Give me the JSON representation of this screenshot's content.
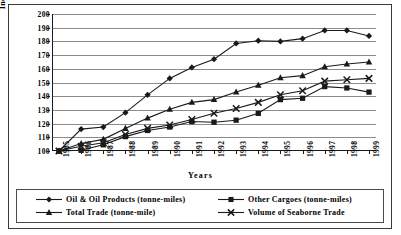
{
  "chart_data": {
    "type": "line",
    "title": "",
    "xlabel": "Years",
    "ylabel": "Index (1985=100)",
    "ylim": [
      100,
      200
    ],
    "ytick_step": 10,
    "yticks": [
      100,
      110,
      120,
      130,
      140,
      150,
      160,
      170,
      180,
      190,
      200
    ],
    "grid": true,
    "legend_position": "bottom",
    "categories": [
      "1985",
      "1986",
      "1987",
      "1988",
      "1989",
      "1990",
      "1991",
      "1992",
      "1993",
      "1994",
      "1995",
      "1996",
      "1997",
      "1998",
      "1999"
    ],
    "series": [
      {
        "name": "Oil & Oil Products (tonne-miles)",
        "marker": "diamond",
        "color": "#1a1a1a",
        "values": [
          100,
          116,
          117.5,
          128,
          141,
          153,
          161,
          167,
          178.5,
          180.5,
          180,
          182,
          188,
          188,
          184
        ]
      },
      {
        "name": "Other Cargoes (tonne-miles)",
        "marker": "square",
        "color": "#1a1a1a",
        "values": [
          100,
          100.5,
          104.5,
          110.5,
          115,
          117.5,
          121.5,
          121,
          122.5,
          127.5,
          137.5,
          138.5,
          147,
          146,
          143
        ]
      },
      {
        "name": "Total Trade (tonne-mile)",
        "marker": "triangle",
        "color": "#1a1a1a",
        "values": [
          100,
          105.5,
          108.5,
          116.5,
          124,
          130.5,
          135.5,
          137.5,
          143,
          148,
          153.5,
          155,
          161.5,
          163.5,
          165
        ]
      },
      {
        "name": "Volume of Seaborne Trade",
        "marker": "x",
        "color": "#1a1a1a",
        "values": [
          100,
          103.5,
          106,
          112,
          116.5,
          119,
          123,
          127.5,
          131,
          135.5,
          141,
          144,
          151,
          152,
          153
        ]
      }
    ]
  },
  "axes": {
    "ylabel": "Index (1985=100)",
    "xlabel": "Years"
  },
  "legend": {
    "items": [
      {
        "label": "Oil & Oil Products (tonne-miles)",
        "marker": "diamond"
      },
      {
        "label": "Other Cargoes (tonne-miles)",
        "marker": "square"
      },
      {
        "label": "Total Trade (tonne-mile)",
        "marker": "triangle"
      },
      {
        "label": "Volume of Seaborne Trade",
        "marker": "x"
      }
    ]
  }
}
